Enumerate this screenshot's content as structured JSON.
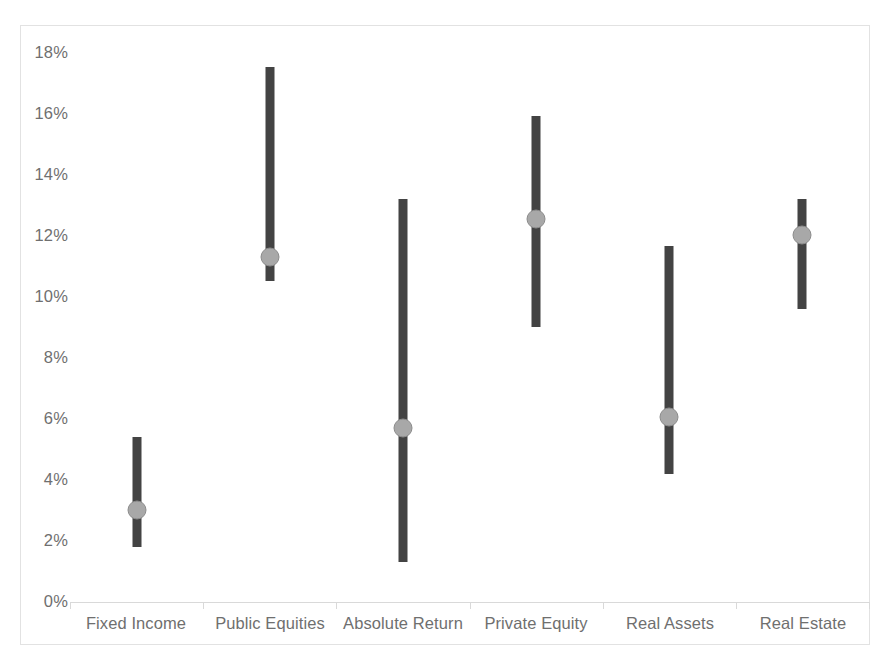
{
  "chart_data": {
    "type": "bar",
    "chart_style": "floating range bar with median marker",
    "title": "",
    "subtitle": "",
    "xlabel": "",
    "ylabel": "",
    "ylim": [
      0,
      18
    ],
    "ytick_step": 2,
    "grid": false,
    "legend": null,
    "value_format": "percent",
    "categories": [
      "Fixed Income",
      "Public Equities",
      "Absolute Return",
      "Private Equity",
      "Real Assets",
      "Real Estate"
    ],
    "ytick_labels": [
      "0%",
      "2%",
      "4%",
      "6%",
      "8%",
      "10%",
      "12%",
      "14%",
      "16%",
      "18%"
    ],
    "ytick_values": [
      0,
      2,
      4,
      6,
      8,
      10,
      12,
      14,
      16,
      18
    ],
    "series": [
      {
        "name": "Range (low to high)",
        "type": "range",
        "low": [
          1.8,
          10.5,
          1.3,
          9.0,
          4.2,
          9.6
        ],
        "high": [
          5.4,
          17.5,
          13.2,
          15.9,
          11.65,
          13.2
        ]
      },
      {
        "name": "Median",
        "type": "marker",
        "values": [
          3.0,
          11.3,
          5.7,
          12.55,
          6.05,
          12.0
        ]
      }
    ],
    "colors": {
      "bar": "#434343",
      "marker_fill": "#a8a8a8",
      "marker_stroke": "#8c8c8c",
      "axis": "#d9d9d9",
      "tick_text": "#6f6f6f",
      "frame": "#e2e2e2",
      "background": "#ffffff"
    }
  }
}
